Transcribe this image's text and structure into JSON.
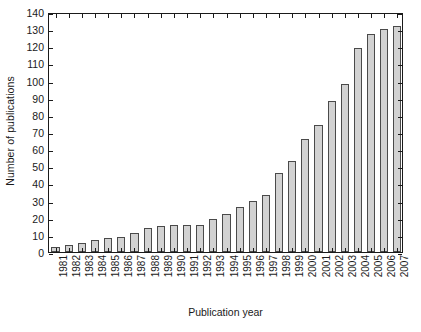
{
  "chart_data": {
    "type": "bar",
    "title": "",
    "xlabel": "Publication year",
    "ylabel": "Number of publications",
    "categories": [
      "1981",
      "1982",
      "1983",
      "1984",
      "1985",
      "1986",
      "1987",
      "1988",
      "1989",
      "1990",
      "1991",
      "1992",
      "1993",
      "1994",
      "1995",
      "1996",
      "1997",
      "1998",
      "1999",
      "2000",
      "2001",
      "2002",
      "2003",
      "2004",
      "2005",
      "2006",
      "2007"
    ],
    "values": [
      3,
      4,
      5,
      7,
      8,
      9,
      11,
      14,
      15,
      16,
      16,
      16,
      19,
      22,
      26,
      30,
      33,
      46,
      53,
      66,
      74,
      88,
      98,
      119,
      127,
      130,
      132
    ],
    "ylim": [
      0,
      140
    ],
    "ytick_labels": [
      "0",
      "10",
      "20",
      "30",
      "40",
      "50",
      "60",
      "70",
      "80",
      "90",
      "100",
      "110",
      "120",
      "130",
      "140"
    ],
    "ytick_values": [
      0,
      10,
      20,
      30,
      40,
      50,
      60,
      70,
      80,
      90,
      100,
      110,
      120,
      130,
      140
    ],
    "grid": false,
    "legend": "none",
    "bar_fill_color": "#d2d2d2",
    "bar_edge_color": "#4a4a4a",
    "axis_color": "#1a1a1a"
  }
}
